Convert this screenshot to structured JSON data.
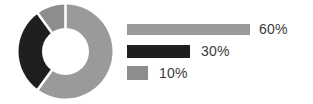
{
  "chart_data": {
    "type": "pie",
    "variant": "donut",
    "title": "",
    "subtitle": "",
    "xlabel": "",
    "ylabel": "",
    "grid": false,
    "legend_position": "right",
    "categories": [
      "60%",
      "30%",
      "10%"
    ],
    "values": [
      60,
      30,
      10
    ],
    "labels": [
      "60%",
      "30%",
      "10%"
    ],
    "colors": [
      "#9a9a9a",
      "#1f1f1f",
      "#8d8d8d"
    ],
    "slices": [
      {
        "label": "60%",
        "value": 60,
        "color": "#9a9a9a",
        "start_angle": 0,
        "end_angle": 216
      },
      {
        "label": "30%",
        "value": 30,
        "color": "#1f1f1f",
        "start_angle": 216,
        "end_angle": 324
      },
      {
        "label": "10%",
        "value": 10,
        "color": "#8d8d8d",
        "start_angle": 324,
        "end_angle": 360
      }
    ],
    "donut_hole_ratio": 0.5,
    "legend": [
      {
        "label": "60%",
        "value": 60,
        "color": "#9a9a9a",
        "bar_width_px": 123
      },
      {
        "label": "30%",
        "value": 30,
        "color": "#1f1f1f",
        "bar_width_px": 63
      },
      {
        "label": "10%",
        "value": 10,
        "color": "#8d8d8d",
        "bar_width_px": 21
      }
    ]
  },
  "figure": {
    "background": "#ffffff",
    "label_color": "#3a3a3a",
    "separator_color": "#ffffff"
  }
}
